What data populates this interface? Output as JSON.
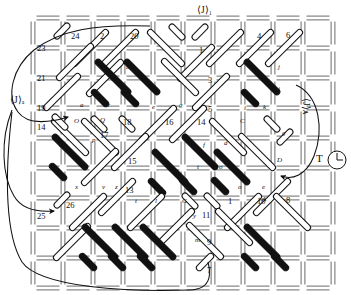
{
  "figure": {
    "name": "lattice-rod-network-diagram",
    "type": "woven-lattice-diagram",
    "background": "#ffffff",
    "ink": "#111111",
    "grid": {
      "cols": 10,
      "rows": 9,
      "cell": 30,
      "origin_x": 33,
      "origin_y": 18,
      "style": "double-line-railroad-segments",
      "segment_color": "#4a4a4a"
    },
    "rod": {
      "white_fill": "#ffffff",
      "white_stroke": "#111111",
      "black_fill": "#111111",
      "black_stroke": "#111111",
      "short_length": 22,
      "long_length": 52,
      "thickness": 6
    }
  },
  "annotations": {
    "top_label": "⟨J⟩₁",
    "left_label": "⟨J⟩ₐ",
    "right_label": "⟨J⟩ᴀ",
    "temperature_label": "T",
    "clock_icon": "clock-icon"
  },
  "node_numbers": [
    {
      "id": "23",
      "x": 37,
      "y": 44
    },
    {
      "id": "24",
      "x": 71,
      "y": 32
    },
    {
      "id": "22",
      "x": 100,
      "y": 32
    },
    {
      "id": "20",
      "x": 130,
      "y": 32
    },
    {
      "id": "1",
      "x": 199,
      "y": 46
    },
    {
      "id": "2",
      "x": 228,
      "y": 32
    },
    {
      "id": "4",
      "x": 257,
      "y": 32
    },
    {
      "id": "6",
      "x": 286,
      "y": 31
    },
    {
      "id": "21",
      "x": 37,
      "y": 74
    },
    {
      "id": "3",
      "x": 208,
      "y": 76
    },
    {
      "id": "19",
      "x": 37,
      "y": 104
    },
    {
      "id": "5",
      "x": 208,
      "y": 105
    },
    {
      "id": "14",
      "x": 37,
      "y": 123
    },
    {
      "id": "18",
      "x": 123,
      "y": 118
    },
    {
      "id": "16",
      "x": 165,
      "y": 118
    },
    {
      "id": "14b",
      "x": 197,
      "y": 118
    },
    {
      "id": "17",
      "x": 100,
      "y": 131
    },
    {
      "id": "15",
      "x": 128,
      "y": 157
    },
    {
      "id": "13",
      "x": 125,
      "y": 186
    },
    {
      "id": "25",
      "x": 37,
      "y": 212
    },
    {
      "id": "26",
      "x": 66,
      "y": 201
    },
    {
      "id": "12",
      "x": 228,
      "y": 197
    },
    {
      "id": "10",
      "x": 257,
      "y": 197
    },
    {
      "id": "8",
      "x": 286,
      "y": 196
    },
    {
      "id": "11",
      "x": 202,
      "y": 211
    },
    {
      "id": "9",
      "x": 207,
      "y": 238
    },
    {
      "id": "7",
      "x": 207,
      "y": 266
    }
  ],
  "rod_letters": [
    {
      "id": "b",
      "x": 126,
      "y": 64
    },
    {
      "id": "d",
      "x": 124,
      "y": 88
    },
    {
      "id": "a",
      "x": 80,
      "y": 102
    },
    {
      "id": "c",
      "x": 107,
      "y": 102
    },
    {
      "id": "e",
      "x": 152,
      "y": 104
    },
    {
      "id": "g",
      "x": 179,
      "y": 102
    },
    {
      "id": "j",
      "x": 278,
      "y": 64
    },
    {
      "id": "i",
      "x": 278,
      "y": 86
    },
    {
      "id": "i2",
      "x": 244,
      "y": 105
    },
    {
      "id": "k",
      "x": 263,
      "y": 104
    },
    {
      "id": "C",
      "x": 240,
      "y": 118
    },
    {
      "id": "g2",
      "x": 282,
      "y": 130
    },
    {
      "id": "O",
      "x": 74,
      "y": 118
    },
    {
      "id": "Q",
      "x": 100,
      "y": 117
    },
    {
      "id": "p",
      "x": 92,
      "y": 137
    },
    {
      "id": "f",
      "x": 203,
      "y": 142
    },
    {
      "id": "d2",
      "x": 224,
      "y": 140
    },
    {
      "id": "u",
      "x": 59,
      "y": 142
    },
    {
      "id": "w",
      "x": 55,
      "y": 170
    },
    {
      "id": "x",
      "x": 75,
      "y": 184
    },
    {
      "id": "v",
      "x": 102,
      "y": 184
    },
    {
      "id": "z",
      "x": 115,
      "y": 184
    },
    {
      "id": "s",
      "x": 160,
      "y": 185
    },
    {
      "id": "q",
      "x": 186,
      "y": 185
    },
    {
      "id": "t",
      "x": 197,
      "y": 164
    },
    {
      "id": "o",
      "x": 219,
      "y": 164
    },
    {
      "id": "o2",
      "x": 238,
      "y": 184
    },
    {
      "id": "e2",
      "x": 262,
      "y": 184
    },
    {
      "id": "A",
      "x": 262,
      "y": 196
    },
    {
      "id": "D",
      "x": 277,
      "y": 157
    },
    {
      "id": "t2",
      "x": 135,
      "y": 198
    },
    {
      "id": "l",
      "x": 155,
      "y": 198
    },
    {
      "id": "G",
      "x": 182,
      "y": 198
    },
    {
      "id": "y",
      "x": 193,
      "y": 213
    },
    {
      "id": "m",
      "x": 195,
      "y": 237
    }
  ],
  "flow_paths": {
    "left_inlet_arrows": 2,
    "right_outlet_arrows": 1,
    "bottom_return_path": true
  }
}
